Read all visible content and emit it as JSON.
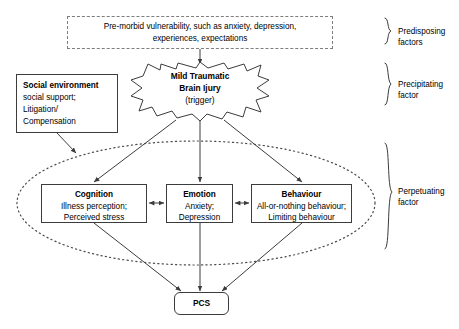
{
  "diagram": {
    "canvas": {
      "width": 459,
      "height": 329,
      "background": "#ffffff"
    },
    "colors": {
      "stroke": "#3c3c3c",
      "dashed_stroke": "#7d7d7d",
      "text": "#000000",
      "ellipse_stroke": "#4a4a4a"
    },
    "nodes": {
      "premorbid": {
        "line1": "Pre-morbid vulnerability, such as anxiety, depression,",
        "line2": "experiences, expectations",
        "shape": "dashed-rectangle"
      },
      "social_environment": {
        "title": "Social environment",
        "line1": "social support;",
        "line2": "Litigation/",
        "line3": "Compensation",
        "shape": "rectangle"
      },
      "mtbi": {
        "title_line1": "Mild Traumatic",
        "title_line2": "Brain Ijury",
        "subtitle": "(trigger)",
        "shape": "explosion-star"
      },
      "cognition": {
        "title": "Cognition",
        "line1": "Illness perception;",
        "line2": "Perceived stress",
        "shape": "rectangle"
      },
      "emotion": {
        "title": "Emotion",
        "line1": "Anxiety;",
        "line2": "Depression",
        "shape": "rectangle"
      },
      "behaviour": {
        "title": "Behaviour",
        "line1": "All-or-nothing behaviour;",
        "line2": "Limiting behaviour",
        "shape": "rectangle"
      },
      "pcs": {
        "title": "PCS",
        "shape": "rounded-rectangle"
      }
    },
    "brace_labels": {
      "predisposing": {
        "line1": "Predisposing",
        "line2": "factors"
      },
      "precipitating": {
        "line1": "Precipitating",
        "line2": "factor"
      },
      "perpetuating": {
        "line1": "Perpetuating",
        "line2": "factor"
      }
    }
  }
}
